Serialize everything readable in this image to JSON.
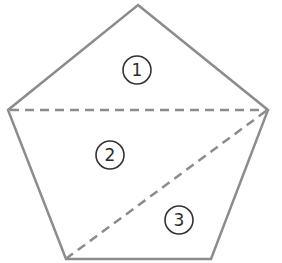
{
  "diagram": {
    "shape": "pentagon",
    "stroke_color": "#8c8c8c",
    "circle_color": "#333333",
    "regions": [
      {
        "label": "1",
        "cx": 137,
        "cy": 70
      },
      {
        "label": "2",
        "cx": 110,
        "cy": 155
      },
      {
        "label": "3",
        "cx": 179,
        "cy": 220
      }
    ]
  }
}
